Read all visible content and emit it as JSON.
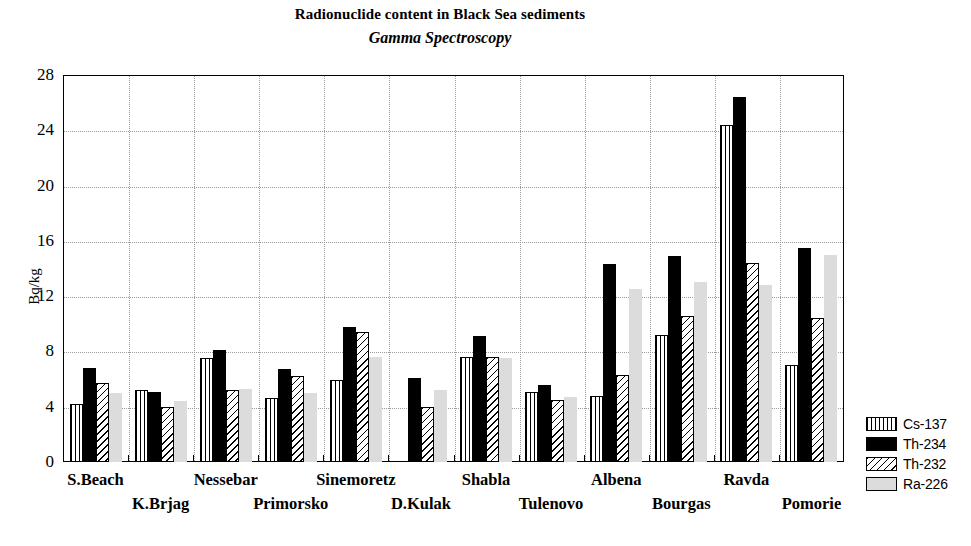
{
  "chart_data": {
    "type": "bar",
    "title": "Radionuclide content in Black Sea sediments",
    "subtitle": "Gamma Spectroscopy",
    "xlabel": "",
    "ylabel": "Bq/kg",
    "ylim": [
      0,
      28
    ],
    "yticks": [
      0,
      4,
      8,
      12,
      16,
      20,
      24,
      28
    ],
    "grid": "horizontal-and-vertical-dotted",
    "legend_position": "right",
    "categories": [
      "S.Beach",
      "K.Brjag",
      "Nessebar",
      "Primorsko",
      "Sinemoretz",
      "D.Kulak",
      "Shabla",
      "Tulenovo",
      "Albena",
      "Bourgas",
      "Ravda",
      "Pomorie"
    ],
    "series": [
      {
        "name": "Cs-137",
        "fill": "vertical-lines",
        "values": [
          4.2,
          5.2,
          7.5,
          4.6,
          5.9,
          0.0,
          7.6,
          5.1,
          4.8,
          9.2,
          24.4,
          7.0
        ]
      },
      {
        "name": "Th-234",
        "fill": "solid-black",
        "values": [
          6.8,
          5.1,
          8.1,
          6.7,
          9.8,
          6.1,
          9.1,
          5.6,
          14.3,
          14.9,
          26.4,
          15.5
        ]
      },
      {
        "name": "Th-232",
        "fill": "diagonal-hatch",
        "values": [
          5.7,
          4.0,
          5.2,
          6.2,
          9.4,
          4.0,
          7.6,
          4.5,
          6.3,
          10.6,
          14.4,
          10.4
        ]
      },
      {
        "name": "Ra-226",
        "fill": "light-grey",
        "values": [
          5.0,
          4.4,
          5.3,
          5.0,
          7.6,
          5.2,
          7.5,
          4.7,
          12.5,
          13.0,
          12.8,
          15.0
        ]
      }
    ]
  },
  "legend": {
    "items": [
      {
        "label": "Cs-137"
      },
      {
        "label": "Th-234"
      },
      {
        "label": "Th-232"
      },
      {
        "label": "Ra-226"
      }
    ]
  }
}
